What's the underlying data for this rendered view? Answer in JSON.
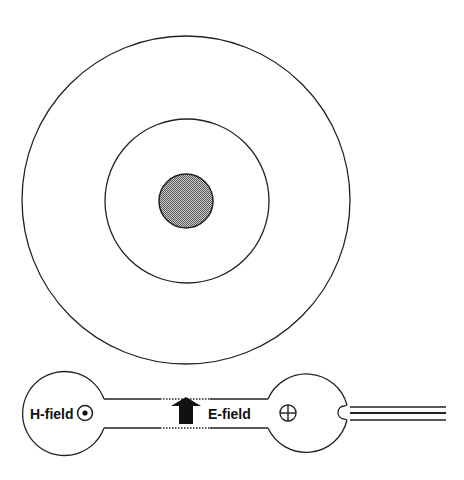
{
  "diagram": {
    "type": "concentric-rings-and-probe",
    "colors": {
      "stroke": "#222222",
      "background": "#ffffff",
      "core_fill": "#8a8a8a"
    },
    "rings": {
      "center": [
        186,
        200
      ],
      "outer_radius": 164,
      "middle_radius": 82,
      "core_radius": 27
    },
    "probe": {
      "labels": {
        "h_field": "H-field",
        "e_field": "E-field"
      },
      "symbols": {
        "out_of_page": "dot-in-circle",
        "into_page": "cross-in-circle",
        "arrow": "up-arrow"
      }
    }
  }
}
